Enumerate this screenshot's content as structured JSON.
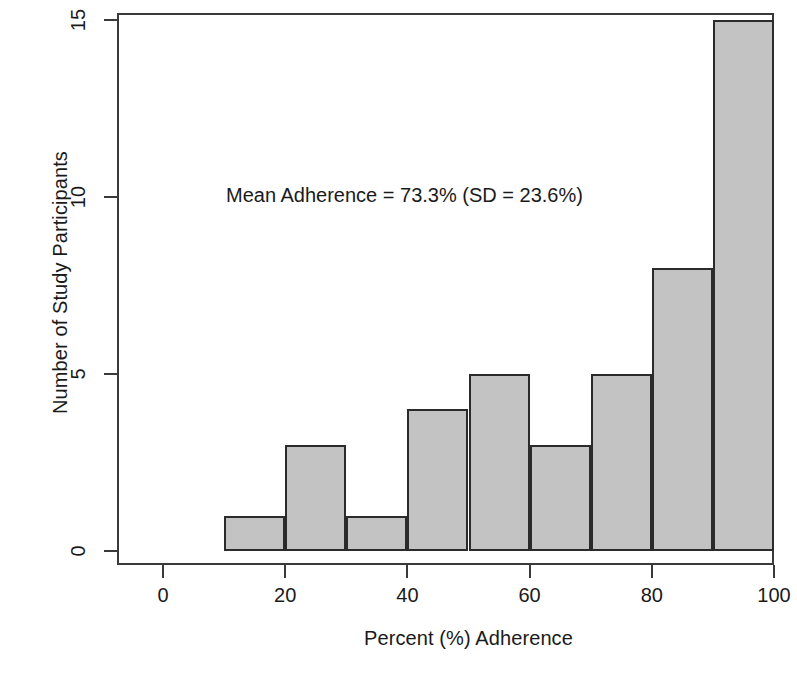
{
  "chart_data": {
    "type": "bar",
    "title": "",
    "subtitle": "",
    "xlabel": "Percent (%) Adherence",
    "ylabel": "Number of Study Participants",
    "xlim": [
      0,
      100
    ],
    "ylim": [
      0,
      15
    ],
    "grid": false,
    "legend": null,
    "bin_width": 10,
    "bin_edges": [
      10,
      20,
      30,
      40,
      50,
      60,
      70,
      80,
      90,
      100
    ],
    "categories": [
      "10-20",
      "20-30",
      "30-40",
      "40-50",
      "50-60",
      "60-70",
      "70-80",
      "80-90",
      "90-100"
    ],
    "values": [
      1,
      3,
      1,
      4,
      5,
      3,
      5,
      8,
      15
    ],
    "bars": [
      {
        "label": "10-20",
        "x0": 10,
        "x1": 20,
        "value": 1
      },
      {
        "label": "20-30",
        "x0": 20,
        "x1": 30,
        "value": 3
      },
      {
        "label": "30-40",
        "x0": 30,
        "x1": 40,
        "value": 1
      },
      {
        "label": "40-50",
        "x0": 40,
        "x1": 50,
        "value": 4
      },
      {
        "label": "50-60",
        "x0": 50,
        "x1": 60,
        "value": 5
      },
      {
        "label": "60-70",
        "x0": 60,
        "x1": 70,
        "value": 3
      },
      {
        "label": "70-80",
        "x0": 70,
        "x1": 80,
        "value": 5
      },
      {
        "label": "80-90",
        "x0": 80,
        "x1": 90,
        "value": 8
      },
      {
        "label": "90-100",
        "x0": 90,
        "x1": 100,
        "value": 15
      }
    ],
    "x_ticks": [
      {
        "value": 0,
        "label": "0"
      },
      {
        "value": 20,
        "label": "20"
      },
      {
        "value": 40,
        "label": "40"
      },
      {
        "value": 60,
        "label": "60"
      },
      {
        "value": 80,
        "label": "80"
      },
      {
        "value": 100,
        "label": "100"
      }
    ],
    "y_ticks": [
      {
        "value": 0,
        "label": "0"
      },
      {
        "value": 5,
        "label": "5"
      },
      {
        "value": 10,
        "label": "10"
      },
      {
        "value": 15,
        "label": "15"
      }
    ],
    "annotations": [
      {
        "text": "Mean Adherence = 73.3% (SD = 23.6%)",
        "x": 40,
        "y": 10.4
      }
    ],
    "colors": {
      "bar_fill": "#c3c3c3",
      "bar_border": "#2b2b2b",
      "axis": "#3a3a3a",
      "text": "#1a1a1a",
      "background": "#ffffff"
    }
  },
  "statistics": {
    "mean_adherence": "73.3%",
    "standard_deviation": "23.6%",
    "annotation_text": "Mean Adherence = 73.3% (SD = 23.6%)"
  }
}
